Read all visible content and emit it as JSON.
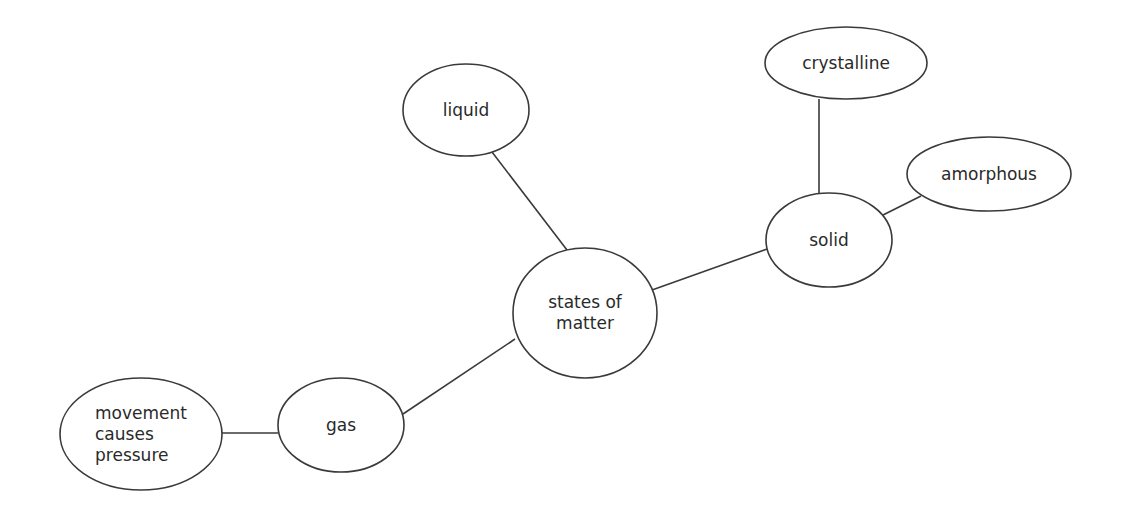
{
  "diagram": {
    "type": "concept-map",
    "colors": {
      "stroke": "#3a3a3a",
      "text": "#2a2a2a",
      "background": "#ffffff"
    },
    "nodes": [
      {
        "id": "center",
        "label": "states of\nmatter",
        "lines": [
          "states of",
          "matter"
        ],
        "cx": 585,
        "cy": 313,
        "rx": 72,
        "ry": 65
      },
      {
        "id": "liquid",
        "label": "liquid",
        "cx": 466,
        "cy": 110,
        "rx": 63,
        "ry": 46
      },
      {
        "id": "solid",
        "label": "solid",
        "cx": 829,
        "cy": 240,
        "rx": 63,
        "ry": 47
      },
      {
        "id": "crystalline",
        "label": "crystalline",
        "cx": 846,
        "cy": 63,
        "rx": 81,
        "ry": 36
      },
      {
        "id": "amorphous",
        "label": "amorphous",
        "cx": 989,
        "cy": 174,
        "rx": 82,
        "ry": 37
      },
      {
        "id": "gas",
        "label": "gas",
        "cx": 341,
        "cy": 425,
        "rx": 63,
        "ry": 47
      },
      {
        "id": "pressure",
        "label": "movement\ncauses\npressure",
        "lines": [
          "movement",
          "causes",
          "pressure"
        ],
        "cx": 141,
        "cy": 434,
        "rx": 81,
        "ry": 56
      }
    ],
    "edges": [
      {
        "from": "center",
        "to": "liquid",
        "x1": 567,
        "y1": 250,
        "x2": 492,
        "y2": 152
      },
      {
        "from": "center",
        "to": "solid",
        "x1": 652,
        "y1": 290,
        "x2": 767,
        "y2": 249
      },
      {
        "from": "center",
        "to": "gas",
        "x1": 515,
        "y1": 339,
        "x2": 403,
        "y2": 414
      },
      {
        "from": "solid",
        "to": "crystalline",
        "x1": 819,
        "y1": 193,
        "x2": 819,
        "y2": 99
      },
      {
        "from": "solid",
        "to": "amorphous",
        "x1": 883,
        "y1": 215,
        "x2": 921,
        "y2": 196
      },
      {
        "from": "gas",
        "to": "pressure",
        "x1": 278,
        "y1": 433,
        "x2": 222,
        "y2": 433
      }
    ]
  }
}
